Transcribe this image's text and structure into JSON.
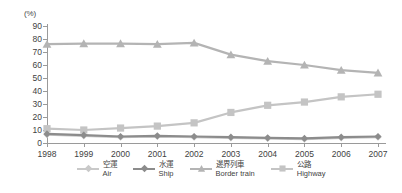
{
  "chart": {
    "unit_label": "(%)",
    "y_ticks": [
      0,
      10,
      20,
      30,
      40,
      50,
      60,
      70,
      80,
      90
    ],
    "x_ticks": [
      "1998",
      "1999",
      "2000",
      "2001",
      "2002",
      "2003",
      "2004",
      "2005",
      "2006",
      "2007"
    ]
  },
  "legend": {
    "items": [
      {
        "cn": "空運",
        "en": "Air",
        "color": "#c9c9c9",
        "symbol": "diamond"
      },
      {
        "cn": "水運",
        "en": "Ship",
        "color": "#8c8c8c",
        "symbol": "diamond"
      },
      {
        "cn": "邊界列車",
        "en": "Border train",
        "color": "#b4b4b4",
        "symbol": "triangle"
      },
      {
        "cn": "公路",
        "en": "Highway",
        "color": "#c4c4c4",
        "symbol": "square"
      }
    ]
  },
  "chart_data": {
    "type": "line",
    "title": "",
    "xlabel": "",
    "ylabel": "(%)",
    "ylim": [
      0,
      90
    ],
    "grid": false,
    "legend_position": "bottom",
    "categories": [
      "1998",
      "1999",
      "2000",
      "2001",
      "2002",
      "2003",
      "2004",
      "2005",
      "2006",
      "2007"
    ],
    "series": [
      {
        "name": "Air",
        "name_cn": "空運",
        "color": "#c9c9c9",
        "symbol": "diamond",
        "values": [
          6.5,
          5.5,
          4.5,
          5.0,
          4.5,
          4.0,
          3.5,
          3.0,
          4.0,
          4.5
        ]
      },
      {
        "name": "Ship",
        "name_cn": "水運",
        "color": "#8c8c8c",
        "symbol": "diamond",
        "values": [
          7.0,
          6.0,
          5.0,
          5.5,
          5.0,
          4.5,
          4.0,
          3.5,
          4.5,
          5.0
        ]
      },
      {
        "name": "Border train",
        "name_cn": "邊界列車",
        "color": "#b4b4b4",
        "symbol": "triangle",
        "values": [
          76.0,
          76.5,
          76.5,
          76.0,
          77.0,
          68.0,
          63.0,
          60.0,
          56.0,
          54.0
        ]
      },
      {
        "name": "Highway",
        "name_cn": "公路",
        "color": "#c4c4c4",
        "symbol": "square",
        "values": [
          11.0,
          10.0,
          11.5,
          13.0,
          15.5,
          23.5,
          29.0,
          31.5,
          35.5,
          37.5
        ]
      }
    ]
  }
}
